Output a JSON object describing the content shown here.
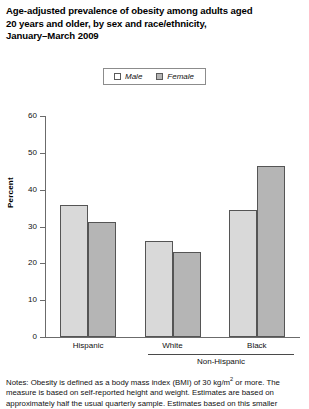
{
  "title": {
    "lines": [
      "Age-adjusted prevalence of obesity among adults aged",
      "20 years and older, by sex and race/ethnicity,",
      "January–March 2009"
    ]
  },
  "legend": {
    "items": [
      {
        "label": "Male",
        "swatch": "legend-swatch-male",
        "color": "#ffffff"
      },
      {
        "label": "Female",
        "swatch": "legend-swatch-female",
        "color": "#b4b4b4"
      }
    ]
  },
  "axes": {
    "ylabel": "Percent",
    "yticks": [
      "0",
      "10",
      "20",
      "30",
      "40",
      "50",
      "60"
    ],
    "xgroups": [
      "Hispanic",
      "White",
      "Black"
    ],
    "xbracket": "Non-Hispanic"
  },
  "notes": {
    "prefix": "Notes:",
    "text_a": " Obesity is defined as a body mass index (BMI) of 30 kg/m",
    "sup": "2",
    "text_b": " or more. The measure is based on self-reported height and weight. Estimates are based on approximately half the usual quarterly sample. Estimates based on this smaller"
  },
  "chart_data": {
    "type": "bar",
    "title": "Age-adjusted prevalence of obesity among adults aged 20 years and older, by sex and race/ethnicity, January–March 2009",
    "xlabel": "",
    "ylabel": "Percent",
    "ylim": [
      0,
      60
    ],
    "yticks": [
      0,
      10,
      20,
      30,
      40,
      50,
      60
    ],
    "grid": false,
    "legend_position": "top-center",
    "categories": [
      "Hispanic",
      "White",
      "Black"
    ],
    "series": [
      {
        "name": "Male",
        "color": "#d9d9d9",
        "values": [
          35.9,
          26.0,
          34.6
        ]
      },
      {
        "name": "Female",
        "color": "#b5b5b5",
        "values": [
          31.3,
          23.0,
          46.5
        ]
      }
    ]
  }
}
